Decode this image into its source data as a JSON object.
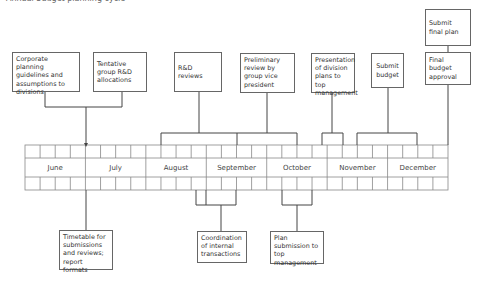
{
  "title": "Annual budget planning cycle",
  "timeline": {
    "months": [
      "June",
      "July",
      "August",
      "September",
      "October",
      "November",
      "December"
    ],
    "weeks_per_month": 4
  },
  "top_events": [
    {
      "id": "corporate-planning",
      "label": "Corporate planning guidelines and assumptions to divisions"
    },
    {
      "id": "tentative-rd",
      "label": "Tentative group R&D allocations"
    },
    {
      "id": "rd-reviews",
      "label": "R&D reviews"
    },
    {
      "id": "preliminary-review",
      "label": "Preliminary review by group vice president"
    },
    {
      "id": "presentation",
      "label": "Presentation of division plans to top management"
    },
    {
      "id": "submit-budget",
      "label": "Submit budget"
    },
    {
      "id": "final-approval",
      "label": "Final budget approval"
    },
    {
      "id": "submit-final-plan",
      "label": "Submit final plan"
    }
  ],
  "bottom_events": [
    {
      "id": "timetable",
      "label": "Timetable for submissions and reviews; report formats"
    },
    {
      "id": "coordination",
      "label": "Coordination of internal transactions"
    },
    {
      "id": "plan-submission",
      "label": "Plan submission to top management"
    }
  ],
  "colors": {
    "line": "#444444",
    "grid": "#888888",
    "box_border": "#666666",
    "text": "#333333"
  }
}
